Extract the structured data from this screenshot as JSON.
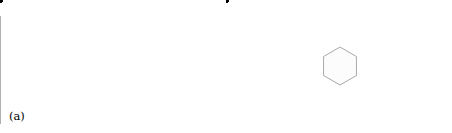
{
  "figure": {
    "type": "two-panel-lattice-diagram",
    "background_color": "#ffffff",
    "width": 452,
    "height": 133,
    "dot_color": "#000000",
    "dot_radius": 2.7,
    "line_color": "#8a8a8a",
    "hex_fill": "#fcfcfc",
    "lattice": {
      "description": "triangular (hexagonal) point lattice",
      "spacing_x": 46,
      "spacing_y": 23,
      "row_offset_x": 23
    }
  },
  "panels": [
    {
      "id": "a",
      "label": "(a)",
      "construction": "wigner-seitz-bisector-lines",
      "center": {
        "x": 114,
        "y": 66
      },
      "dots": [
        {
          "x": 91,
          "y": 12
        },
        {
          "x": 137,
          "y": 12
        },
        {
          "x": 160,
          "y": 12
        },
        {
          "x": 183,
          "y": 12
        },
        {
          "x": 114,
          "y": 12
        },
        {
          "x": 75,
          "y": 35
        },
        {
          "x": 98,
          "y": 35
        },
        {
          "x": 121,
          "y": 35
        },
        {
          "x": 144,
          "y": 35
        },
        {
          "x": 167,
          "y": 35
        },
        {
          "x": 60,
          "y": 66
        },
        {
          "x": 91,
          "y": 66
        },
        {
          "x": 114,
          "y": 66
        },
        {
          "x": 137,
          "y": 66
        },
        {
          "x": 191,
          "y": 66
        },
        {
          "x": 45,
          "y": 89
        },
        {
          "x": 79,
          "y": 89
        },
        {
          "x": 110,
          "y": 89
        },
        {
          "x": 141,
          "y": 89
        },
        {
          "x": 173,
          "y": 89
        },
        {
          "x": 33,
          "y": 118
        },
        {
          "x": 64,
          "y": 118
        },
        {
          "x": 96,
          "y": 118
        },
        {
          "x": 128,
          "y": 118
        },
        {
          "x": 160,
          "y": 118
        }
      ],
      "dot_count": 25,
      "line_count": 6
    },
    {
      "id": "b",
      "label": "(b)",
      "construction": "wigner-seitz-hexagonal-cells",
      "center": {
        "x": 114,
        "y": 66
      },
      "hexagon_count": 7,
      "hexagon_orientation": "pointy-top",
      "hexagon_radius": 19,
      "dot_count": 25
    }
  ],
  "colors": {
    "dot": "#000000",
    "line": "#8a8a8a",
    "hexagon_stroke": "#9a9a9a",
    "hexagon_fill": "#fcfcfc",
    "background": "#ffffff",
    "label_text": "#000000"
  }
}
